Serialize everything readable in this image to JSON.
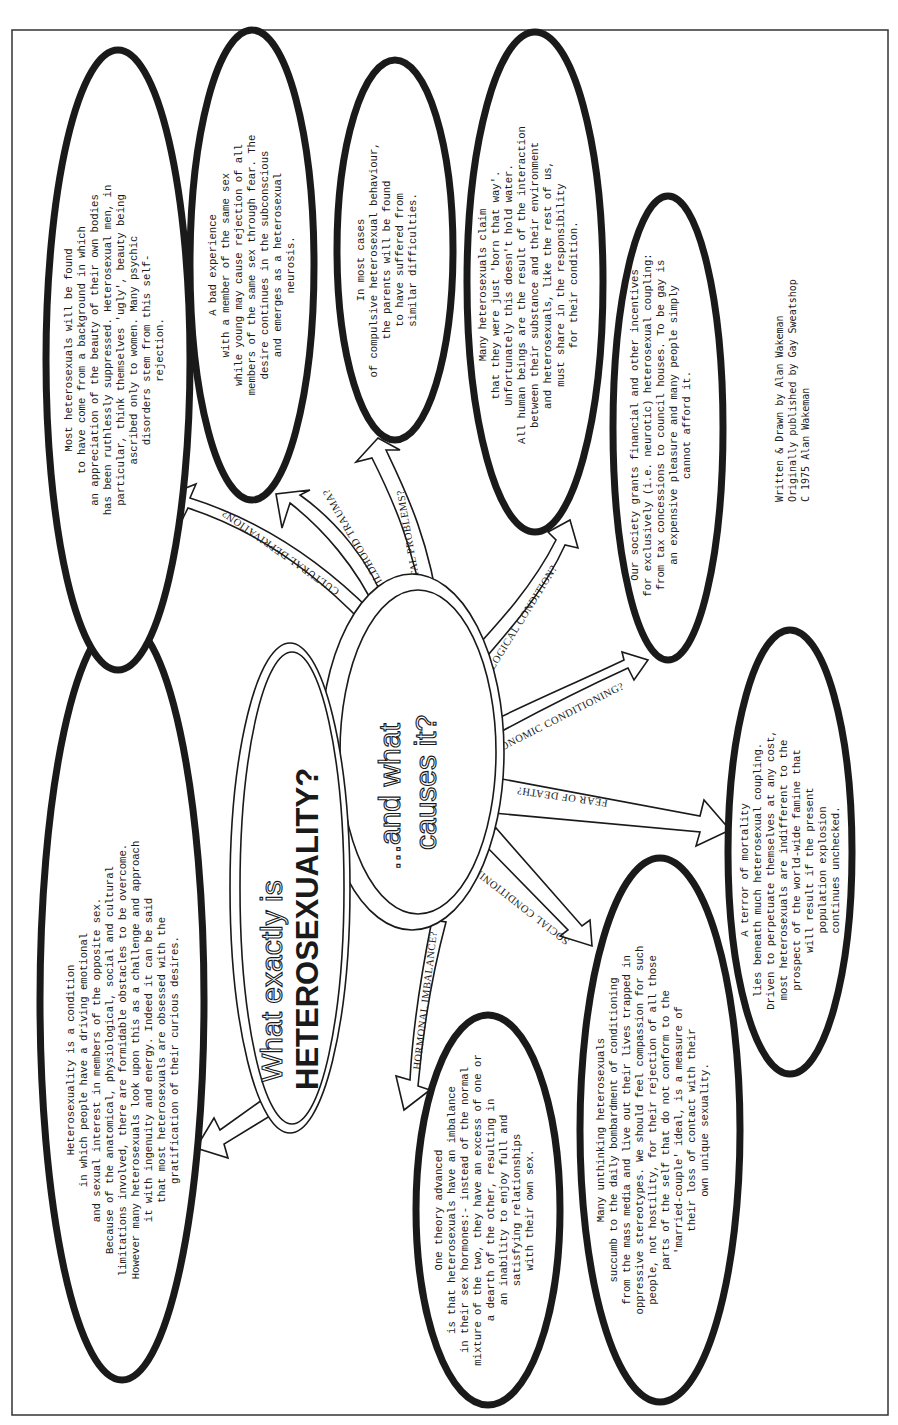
{
  "poster": {
    "title_line1": "What exactly is",
    "title_line2": "HETEROSEXUALITY?",
    "subtitle_line1": "...and what",
    "subtitle_line2": "causes it?"
  },
  "definition_bubble": {
    "lines": [
      "Heterosexuality is a condition",
      "in which people have a driving emotional",
      "and sexual interest in members of the opposite sex.",
      "Because of the anatomical, physiological, social and cultural",
      "limitations involved, there are formidable obstacles to be overcome.",
      "However many heterosexuals look upon this as a challenge and approach",
      "it with ingenuity and energy.  Indeed it can be said",
      "that most heterosexuals are obsessed with the",
      "gratification of their curious desires."
    ]
  },
  "causes": [
    {
      "label": "CULTURAL DEPRIVATION?",
      "lines": [
        "Most heterosexuals will be found",
        "to have come from a background in which",
        "an appreciation of the beauty of their own bodies",
        "has been ruthlessly suppressed.  Heterosexual men, in",
        "particular, think themselves 'ugly', beauty being",
        "ascribed only to women.  Many psychic",
        "disorders stem from this self-",
        "rejection."
      ]
    },
    {
      "label": "CHILDHOOD TRAUMA?",
      "lines": [
        "A bad experience",
        "with a member of the same sex",
        "while young may cause rejection of all",
        "members of the same sex through fear.  The",
        "desire continues in the subconscious",
        "and emerges as a heterosexual",
        "neurosis."
      ]
    },
    {
      "label": "PARENTAL PROBLEMS?",
      "lines": [
        "In most cases",
        "of compulsive heterosexual behaviour,",
        "the parents will be found",
        "to have suffered from",
        "similar difficulties."
      ]
    },
    {
      "label": "PATHOLOGICAL CONDITION?",
      "lines": [
        "Many heterosexuals claim",
        "that they were just 'born that way'.",
        "Unfortunately this doesn't hold water.",
        "All human beings are the result of the interaction",
        "between their substance and their environment",
        "and heterosexuals, like the rest of us,",
        "must share in the responsibility",
        "for their condition."
      ]
    },
    {
      "label": "ECONOMIC CONDITIONING?",
      "lines": [
        "Our society grants financial and other incentives",
        "for exclusively (i.e. neurotic) heterosexual coupling:",
        "from tax concessions to council houses.  To be gay is",
        "an expensive pleasure and many people simply",
        "cannot afford it."
      ]
    },
    {
      "label": "FEAR OF DEATH?",
      "lines": [
        "A terror of mortality",
        "lies beneath much heterosexual coupling.",
        "Driven to perpetuate themselves at any cost,",
        "most heterosexuals are indifferent to the",
        "prospect of the world-wide famine that",
        "will result if the present",
        "population explosion",
        "continues unchecked."
      ]
    },
    {
      "label": "SOCIAL CONDITIONING?",
      "lines": [
        "Many unthinking heterosexuals",
        "succumb to the daily bombardment of conditioning",
        "from the mass media and live out their lives trapped in",
        "oppressive stereotypes.  We should feel compassion for such",
        "people, not hostility, for their rejection of all those",
        "parts of the self that do not conform to the",
        "'married-couple' ideal, is a measure of",
        "their loss of contact with their",
        "own unique sexuality."
      ]
    },
    {
      "label": "HORMONAL IMBALANCE?",
      "lines": [
        "One theory advanced",
        "is that heterosexuals have an imbalance",
        "in their sex hormones:-  instead of the normal",
        "mixture of the two, they have an excess of one or",
        "a dearth of the other, resulting in",
        "an inability to enjoy full and",
        "satisfying relationships",
        "with their own sex."
      ]
    }
  ],
  "credits": {
    "line1": "Written & Drawn by Alan Wakeman",
    "line2": "Originally published by Gay Sweatshop",
    "line3": "C 1975 Alan Wakeman"
  },
  "colors": {
    "ink": "#1a1a1a",
    "paper": "#ffffff"
  }
}
